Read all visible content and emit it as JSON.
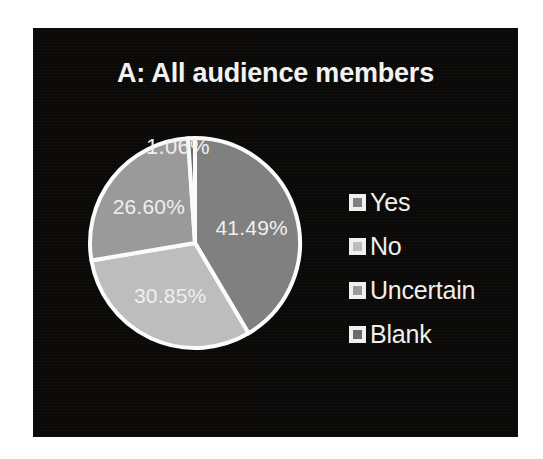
{
  "figure": {
    "panel_background": "#0a0908",
    "page_background": "#ffffff",
    "text_color": "#f0efed",
    "slice_border_color": "#fbfbf9"
  },
  "chart_data": {
    "type": "pie",
    "title": "A: All audience members",
    "categories": [
      "Yes",
      "No",
      "Uncertain",
      "Blank"
    ],
    "values": [
      41.49,
      30.85,
      26.6,
      1.06
    ],
    "value_labels": [
      "41.49%",
      "30.85%",
      "26.60%",
      "1.06%"
    ],
    "colors": [
      "#808080",
      "#bdbdbd",
      "#9a9a9a",
      "#6b6b6b"
    ],
    "units": "percent",
    "start_angle_deg": 0,
    "direction": "clockwise",
    "legend_position": "right",
    "legend_entries": [
      "Yes",
      "No",
      "Uncertain",
      "Blank"
    ],
    "grid": false,
    "xlabel": "",
    "ylabel": "",
    "slices": [
      {
        "label": "Yes",
        "value": 41.49,
        "display": "41.49%",
        "color": "#808080",
        "label_inside": true
      },
      {
        "label": "No",
        "value": 30.85,
        "display": "30.85%",
        "color": "#bdbdbd",
        "label_inside": true
      },
      {
        "label": "Uncertain",
        "value": 26.6,
        "display": "26.60%",
        "color": "#9a9a9a",
        "label_inside": true
      },
      {
        "label": "Blank",
        "value": 1.06,
        "display": "1.06%",
        "color": "#6b6b6b",
        "label_inside": false
      }
    ]
  },
  "labels": {
    "yes_pct": "41.49%",
    "no_pct": "30.85%",
    "uncertain_pct": "26.60%",
    "blank_pct": "1.06%"
  },
  "legend": {
    "items": [
      {
        "label": "Yes",
        "swatch": "#808080"
      },
      {
        "label": "No",
        "swatch": "#bdbdbd"
      },
      {
        "label": "Uncertain",
        "swatch": "#9a9a9a"
      },
      {
        "label": "Blank",
        "swatch": "#6b6b6b"
      }
    ]
  }
}
